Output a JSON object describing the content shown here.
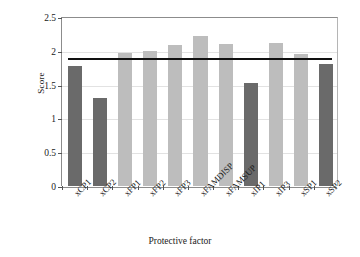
{
  "chart_data": {
    "type": "bar",
    "title": "",
    "xlabel": "Protective factor",
    "ylabel": "Score",
    "categories": [
      "xCP1",
      "xCP2",
      "xFP1",
      "xFP2",
      "xFP3",
      "xFAMDISP",
      "xFAMSUP",
      "xIP1",
      "xIP3",
      "xSP1",
      "xSP2"
    ],
    "values": [
      1.78,
      1.3,
      1.97,
      2.0,
      2.09,
      2.22,
      2.1,
      1.53,
      2.12,
      1.95,
      1.8
    ],
    "bar_colors": [
      "#6a6a6a",
      "#6a6a6a",
      "#bdbdbd",
      "#bdbdbd",
      "#bdbdbd",
      "#bdbdbd",
      "#bdbdbd",
      "#6a6a6a",
      "#bdbdbd",
      "#bdbdbd",
      "#6a6a6a"
    ],
    "ylim": [
      0,
      2.5
    ],
    "yticks": [
      0,
      0.5,
      1,
      1.5,
      2,
      2.5
    ],
    "ytick_labels": [
      "0",
      "0.5",
      "1",
      "1.5",
      "2",
      "2.5"
    ],
    "grid": true,
    "legend": "none",
    "reference_line": {
      "value": 1.9,
      "color": "#111111",
      "orientation": "horizontal"
    }
  }
}
